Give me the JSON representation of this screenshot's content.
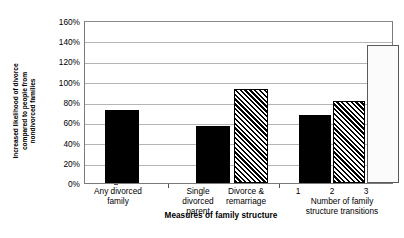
{
  "chart_data": {
    "type": "bar",
    "title": "",
    "xlabel": "Measures of family structure",
    "ylabel": "Increased likelihood of divorce compared to people from nondivorced families",
    "ylabel_lines": [
      "Increased likelihood of divorce",
      "compared to people from",
      "nondivorced families"
    ],
    "ylim": [
      0,
      160
    ],
    "ytick_step": 20,
    "ytick_labels": [
      "160%",
      "140%",
      "120%",
      "100%",
      "80%",
      "60%",
      "40%",
      "20%",
      "0%"
    ],
    "ytick_values": [
      160,
      140,
      120,
      100,
      80,
      60,
      40,
      20,
      0
    ],
    "grid": true,
    "legend": "none",
    "categories": [
      "Any divorced family",
      "Single divorced parent",
      "Divorce & remarriage",
      "1",
      "2",
      "3"
    ],
    "values": [
      73,
      57,
      93,
      68,
      82,
      137
    ],
    "groups": [
      {
        "group_label_lines": [
          "Any divorced",
          "family"
        ],
        "bars": [
          {
            "label": "Any divorced family",
            "value": 73,
            "pattern": "solid"
          }
        ]
      },
      {
        "group_label_lines": [],
        "bars": [
          {
            "label": "Single divorced parent",
            "value": 57,
            "pattern": "solid"
          },
          {
            "label": "Divorce & remarriage",
            "value": 93,
            "pattern": "hatch"
          }
        ],
        "bar_label_lines": [
          [
            "Single",
            "divorced",
            "parent"
          ],
          [
            "Divorce &",
            "remarriage"
          ]
        ]
      },
      {
        "group_label_lines": [
          "Number of family",
          "structure transitions"
        ],
        "bars": [
          {
            "label": "1",
            "value": 68,
            "pattern": "solid"
          },
          {
            "label": "2",
            "value": 82,
            "pattern": "hatch"
          },
          {
            "label": "3",
            "value": 137,
            "pattern": "dotted"
          }
        ]
      }
    ],
    "colors": {
      "solid": "#000000",
      "hatch": "#000000",
      "dotted": "#8d8d8d",
      "gridline": "#b4b4b4",
      "axis": "#7b7b7b",
      "background": "#ffffff"
    }
  },
  "labels": {
    "y_title_line1": "Increased likelihood of divorce",
    "y_title_line2": "compared to people from",
    "y_title_line3": "nondivorced families",
    "x_title": "Measures of family structure",
    "g1_line1": "Any divorced",
    "g1_line2": "family",
    "g2b1_line1": "Single",
    "g2b1_line2": "divorced",
    "g2b1_line3": "parent",
    "g2b2_line1": "Divorce &",
    "g2b2_line2": "remarriage",
    "g3_tick1": "1",
    "g3_tick2": "2",
    "g3_tick3": "3",
    "g3_line1": "Number of family",
    "g3_line2": "structure transitions",
    "ytick_160": "160%",
    "ytick_140": "140%",
    "ytick_120": "120%",
    "ytick_100": "100%",
    "ytick_80": "80%",
    "ytick_60": "60%",
    "ytick_40": "40%",
    "ytick_20": "20%",
    "ytick_0": "0%"
  }
}
